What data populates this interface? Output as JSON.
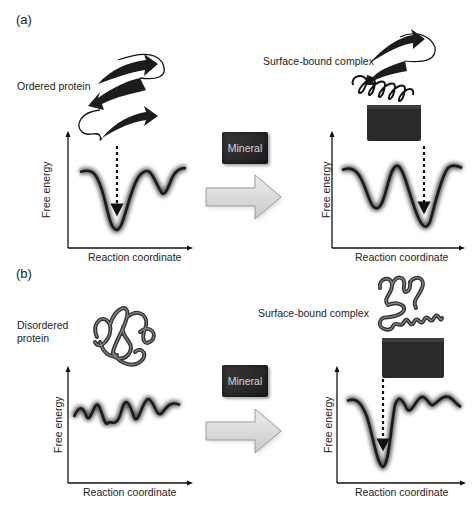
{
  "figure": {
    "panels": [
      {
        "label": "(a)",
        "left_caption": "Ordered protein",
        "right_caption": "Surface-bound complex",
        "mineral_label": "Mineral",
        "left_plot": {
          "ylabel": "Free energy",
          "xlabel": "Reaction coordinate"
        },
        "right_plot": {
          "ylabel": "Free energy",
          "xlabel": "Reaction coordinate"
        }
      },
      {
        "label": "(b)",
        "left_caption_line1": "Disordered",
        "left_caption_line2": "protein",
        "right_caption": "Surface-bound complex",
        "mineral_label": "Mineral",
        "left_plot": {
          "ylabel": "Free energy",
          "xlabel": "Reaction coordinate"
        },
        "right_plot": {
          "ylabel": "Free energy",
          "xlabel": "Reaction coordinate"
        }
      }
    ],
    "colors": {
      "curve": "#1a1a1a",
      "mineral": "#2a2a2a",
      "arrow_fill": "#d9d9d9",
      "arrow_stroke": "#9a9a9a"
    }
  }
}
